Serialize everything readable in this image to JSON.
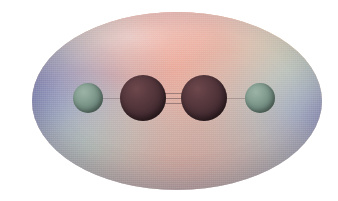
{
  "figure": {
    "kind": "molecular-electrostatic-potential-surface",
    "molecule_name": "acetylene",
    "molecular_formula": "C2H2",
    "representation": "ball-and-stick with mapped electrostatic potential isosurface",
    "caption": ""
  },
  "surface": {
    "name": "electrostatic-potential-isosurface",
    "shape": "ellipsoid",
    "bounds_px": {
      "left": 32,
      "top": 12,
      "width": 290,
      "height": 178
    },
    "regions": [
      {
        "label": "center-top",
        "color": "#f49a86",
        "meaning": "pi-cloud region"
      },
      {
        "label": "upper-left-band",
        "color": "#e6e8a8",
        "meaning": "intermediate potential"
      },
      {
        "label": "upper-right-band",
        "color": "#ecee96",
        "meaning": "intermediate potential"
      },
      {
        "label": "left-flank",
        "color": "#6c7bbe",
        "meaning": "positive potential near H"
      },
      {
        "label": "right-flank",
        "color": "#8fc4d6",
        "meaning": "positive potential near H"
      },
      {
        "label": "lower-left-highlight",
        "color": "#b0e2d2",
        "meaning": "intermediate potential"
      },
      {
        "label": "lower-center",
        "color": "#cfa49c",
        "meaning": "shaded underside"
      }
    ],
    "background_color": "#ffffff"
  },
  "atoms": [
    {
      "id": "H1",
      "element": "H",
      "label": "hydrogen",
      "color": "#718b80",
      "cx": 88,
      "cy": 98,
      "r": 15
    },
    {
      "id": "C1",
      "element": "C",
      "label": "carbon",
      "color": "#4a3036",
      "cx": 143,
      "cy": 98,
      "r": 23
    },
    {
      "id": "C2",
      "element": "C",
      "label": "carbon",
      "color": "#4a3036",
      "cx": 204,
      "cy": 98,
      "r": 23
    },
    {
      "id": "H2",
      "element": "H",
      "label": "hydrogen",
      "color": "#718b80",
      "cx": 260,
      "cy": 98,
      "r": 15
    }
  ],
  "bonds": [
    {
      "id": "H1-C1",
      "from": "H1",
      "to": "C1",
      "order": 1,
      "label": "single bond"
    },
    {
      "id": "C1-C2",
      "from": "C1",
      "to": "C2",
      "order": 3,
      "label": "triple bond"
    },
    {
      "id": "C2-H2",
      "from": "C2",
      "to": "H2",
      "order": 1,
      "label": "single bond"
    }
  ],
  "geometry": {
    "arrangement": "linear",
    "bond_angle_deg": 180
  }
}
